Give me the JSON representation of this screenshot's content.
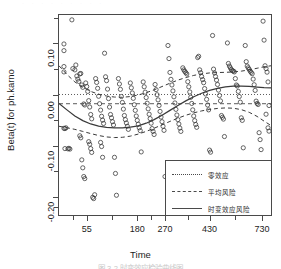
{
  "figure": {
    "top_bleed_text": "· · ·   · · · ·   · ·",
    "caption": "图 3-2  时变效应检验曲线图"
  },
  "axes": {
    "ylabel": "Beta(t) for ph.karno",
    "xlabel": "Time",
    "y_ticks": [
      "0.10",
      "0.00",
      "-0.10",
      "-0.20"
    ],
    "x_ticks": [
      "55",
      "180",
      "270",
      "430",
      "730"
    ]
  },
  "legend": {
    "items": [
      {
        "label": "零效应",
        "style": "dotted"
      },
      {
        "label": "平均风险",
        "style": "dashed"
      },
      {
        "label": "时变效应风险",
        "style": "solid"
      }
    ]
  },
  "chart_data": {
    "type": "scatter",
    "title": "",
    "xlabel": "Time",
    "ylabel": "Beta(t) for ph.karno",
    "xlim": [
      0,
      214
    ],
    "ylim": [
      -0.235,
      0.155
    ],
    "ytick_values": [
      0.1,
      0.0,
      -0.1,
      -0.2
    ],
    "xtick_labels": [
      "55",
      "180",
      "270",
      "430",
      "730"
    ],
    "xtick_positions": [
      28,
      79,
      107,
      152,
      205
    ],
    "grid": false,
    "legend_position": "bottom-right",
    "reference_lines": [
      {
        "name": "零效应",
        "y": 0.0,
        "style": "dotted"
      },
      {
        "name": "平均风险",
        "y": -0.018,
        "style": "dashed"
      }
    ],
    "series": [
      {
        "name": "时变效应风险",
        "type": "line",
        "style": "solid",
        "points": [
          [
            0,
            -0.0175
          ],
          [
            8,
            -0.03
          ],
          [
            16,
            -0.042
          ],
          [
            24,
            -0.051
          ],
          [
            32,
            -0.0575
          ],
          [
            40,
            -0.0615
          ],
          [
            48,
            -0.064
          ],
          [
            56,
            -0.065
          ],
          [
            64,
            -0.065
          ],
          [
            72,
            -0.0638
          ],
          [
            80,
            -0.061
          ],
          [
            88,
            -0.056
          ],
          [
            96,
            -0.049
          ],
          [
            104,
            -0.0405
          ],
          [
            112,
            -0.031
          ],
          [
            120,
            -0.0215
          ],
          [
            128,
            -0.0125
          ],
          [
            136,
            -0.0045
          ],
          [
            144,
            0.0025
          ],
          [
            152,
            0.008
          ],
          [
            160,
            0.012
          ],
          [
            168,
            0.0148
          ],
          [
            176,
            0.0162
          ],
          [
            184,
            0.0165
          ],
          [
            192,
            0.0158
          ],
          [
            200,
            0.0145
          ],
          [
            207,
            0.0135
          ],
          [
            214,
            0.013
          ]
        ]
      },
      {
        "name": "上置信带",
        "type": "line",
        "style": "dashed",
        "points": [
          [
            0,
            0.056
          ],
          [
            8,
            0.039
          ],
          [
            16,
            0.0245
          ],
          [
            24,
            0.014
          ],
          [
            32,
            0.006
          ],
          [
            40,
            0.0005
          ],
          [
            48,
            -0.003
          ],
          [
            56,
            -0.005
          ],
          [
            64,
            -0.0055
          ],
          [
            72,
            -0.004
          ],
          [
            80,
            -0.001
          ],
          [
            88,
            0.0035
          ],
          [
            96,
            0.009
          ],
          [
            104,
            0.0155
          ],
          [
            112,
            0.022
          ],
          [
            120,
            0.028
          ],
          [
            128,
            0.033
          ],
          [
            136,
            0.0372
          ],
          [
            144,
            0.0402
          ],
          [
            152,
            0.042
          ],
          [
            160,
            0.0428
          ],
          [
            168,
            0.0432
          ],
          [
            176,
            0.044
          ],
          [
            184,
            0.0455
          ],
          [
            192,
            0.048
          ],
          [
            200,
            0.0512
          ],
          [
            207,
            0.054
          ],
          [
            214,
            0.056
          ]
        ]
      },
      {
        "name": "下置信带",
        "type": "line",
        "style": "dashed",
        "points": [
          [
            0,
            -0.062
          ],
          [
            8,
            -0.0648
          ],
          [
            16,
            -0.068
          ],
          [
            24,
            -0.072
          ],
          [
            32,
            -0.0762
          ],
          [
            40,
            -0.08
          ],
          [
            48,
            -0.0828
          ],
          [
            56,
            -0.084
          ],
          [
            64,
            -0.0835
          ],
          [
            72,
            -0.0812
          ],
          [
            80,
            -0.0772
          ],
          [
            88,
            -0.072
          ],
          [
            96,
            -0.0658
          ],
          [
            104,
            -0.0592
          ],
          [
            112,
            -0.0525
          ],
          [
            120,
            -0.0462
          ],
          [
            128,
            -0.0405
          ],
          [
            136,
            -0.0358
          ],
          [
            144,
            -0.032
          ],
          [
            152,
            -0.0292
          ],
          [
            160,
            -0.0272
          ],
          [
            168,
            -0.0262
          ],
          [
            176,
            -0.0268
          ],
          [
            184,
            -0.0295
          ],
          [
            192,
            -0.0348
          ],
          [
            200,
            -0.0428
          ],
          [
            207,
            -0.052
          ],
          [
            214,
            -0.0605
          ]
        ]
      },
      {
        "name": "Schoenfeld 残差",
        "type": "scatter",
        "marker": "open-circle",
        "points": [
          [
            5,
            0.0985
          ],
          [
            5,
            0.0855
          ],
          [
            5,
            0.0545
          ],
          [
            5,
            0.044
          ],
          [
            5,
            -0.066
          ],
          [
            6,
            -0.0665
          ],
          [
            7,
            -0.065
          ],
          [
            6,
            -0.1055
          ],
          [
            9,
            -0.106
          ],
          [
            10,
            -0.105
          ],
          [
            11,
            -0.1065
          ],
          [
            13,
            0.1455
          ],
          [
            14,
            0.0505
          ],
          [
            16,
            0.048
          ],
          [
            17,
            0.0575
          ],
          [
            18,
            0.036
          ],
          [
            19,
            0.03
          ],
          [
            20,
            0.0255
          ],
          [
            21,
            0.04
          ],
          [
            22,
            0.041
          ],
          [
            23,
            0.0185
          ],
          [
            24,
            0.014
          ],
          [
            25,
            -0.0185
          ],
          [
            26,
            -0.0205
          ],
          [
            21,
            -0.0805
          ],
          [
            22,
            -0.0845
          ],
          [
            23,
            -0.1275
          ],
          [
            24,
            -0.143
          ],
          [
            25,
            -0.16
          ],
          [
            26,
            -0.164
          ],
          [
            27,
            0.0225
          ],
          [
            28,
            0.0155
          ],
          [
            29,
            0.006
          ],
          [
            30,
            -0.012
          ],
          [
            31,
            -0.0245
          ],
          [
            32,
            -0.039
          ],
          [
            33,
            -0.0475
          ],
          [
            30,
            -0.092
          ],
          [
            31,
            -0.097
          ],
          [
            32,
            -0.1055
          ],
          [
            33,
            -0.113
          ],
          [
            34,
            -0.2005
          ],
          [
            35,
            -0.203
          ],
          [
            36,
            -0.1955
          ],
          [
            37,
            0.031
          ],
          [
            38,
            0.0235
          ],
          [
            39,
            0.012
          ],
          [
            40,
            -0.0035
          ],
          [
            41,
            -0.018
          ],
          [
            42,
            -0.0305
          ],
          [
            43,
            -0.0425
          ],
          [
            44,
            -0.05
          ],
          [
            45,
            -0.0565
          ],
          [
            42,
            -0.0935
          ],
          [
            43,
            -0.1015
          ],
          [
            44,
            -0.1225
          ],
          [
            46,
            0.0805
          ],
          [
            47,
            0.0345
          ],
          [
            48,
            0.027
          ],
          [
            49,
            0.0105
          ],
          [
            50,
            -0.008
          ],
          [
            51,
            -0.0245
          ],
          [
            52,
            -0.039
          ],
          [
            53,
            -0.0455
          ],
          [
            54,
            -0.053
          ],
          [
            55,
            -0.0595
          ],
          [
            56,
            -0.1225
          ],
          [
            57,
            -0.154
          ],
          [
            58,
            -0.1965
          ],
          [
            60,
            0.031
          ],
          [
            61,
            0.0205
          ],
          [
            62,
            0.01
          ],
          [
            63,
            -0.004
          ],
          [
            64,
            -0.0155
          ],
          [
            65,
            -0.0285
          ],
          [
            66,
            -0.041
          ],
          [
            67,
            -0.049
          ],
          [
            68,
            -0.0555
          ],
          [
            69,
            -0.062
          ],
          [
            70,
            -0.068
          ],
          [
            72,
            0.0225
          ],
          [
            73,
            0.013
          ],
          [
            74,
            0.003
          ],
          [
            75,
            -0.0075
          ],
          [
            76,
            -0.02
          ],
          [
            77,
            -0.031
          ],
          [
            78,
            -0.042
          ],
          [
            79,
            -0.0505
          ],
          [
            80,
            -0.058
          ],
          [
            81,
            -0.065
          ],
          [
            82,
            -0.0705
          ],
          [
            83,
            -0.112
          ],
          [
            85,
            0.0245
          ],
          [
            86,
            0.015
          ],
          [
            87,
            0.0045
          ],
          [
            88,
            -0.006
          ],
          [
            89,
            -0.017
          ],
          [
            90,
            -0.028
          ],
          [
            91,
            -0.0385
          ],
          [
            92,
            -0.047
          ],
          [
            93,
            -0.056
          ],
          [
            94,
            -0.0665
          ],
          [
            95,
            -0.072
          ],
          [
            96,
            -0.078
          ],
          [
            97,
            0.0195
          ],
          [
            98,
            0.0095
          ],
          [
            99,
            -0.0005
          ],
          [
            100,
            -0.0105
          ],
          [
            101,
            -0.0215
          ],
          [
            102,
            -0.033
          ],
          [
            103,
            -0.044
          ],
          [
            104,
            -0.053
          ],
          [
            105,
            -0.062
          ],
          [
            106,
            -0.07
          ],
          [
            107,
            -0.16
          ],
          [
            110,
            0.0955
          ],
          [
            111,
            0.07
          ],
          [
            112,
            0.043
          ],
          [
            113,
            0.0295
          ],
          [
            114,
            0.0185
          ],
          [
            115,
            0.007
          ],
          [
            116,
            -0.0045
          ],
          [
            117,
            -0.0165
          ],
          [
            118,
            -0.029
          ],
          [
            119,
            -0.04
          ],
          [
            120,
            -0.049
          ],
          [
            121,
            -0.0575
          ],
          [
            122,
            -0.0655
          ],
          [
            123,
            -0.072
          ],
          [
            125,
            0.052
          ],
          [
            126,
            0.048
          ],
          [
            127,
            0.045
          ],
          [
            128,
            0.0425
          ],
          [
            129,
            0.04
          ],
          [
            130,
            0.025
          ],
          [
            131,
            0.015
          ],
          [
            132,
            0.005
          ],
          [
            133,
            -0.0055
          ],
          [
            134,
            -0.0175
          ],
          [
            135,
            -0.03
          ],
          [
            136,
            -0.042
          ],
          [
            137,
            -0.051
          ],
          [
            138,
            -0.0585
          ],
          [
            139,
            -0.064
          ],
          [
            140,
            0.072
          ],
          [
            141,
            0.0745
          ],
          [
            142,
            0.048
          ],
          [
            143,
            0.0425
          ],
          [
            144,
            0.035
          ],
          [
            145,
            0.029
          ],
          [
            146,
            0.023
          ],
          [
            147,
            0.0115
          ],
          [
            148,
            0.001
          ],
          [
            149,
            -0.0095
          ],
          [
            150,
            -0.0205
          ],
          [
            151,
            -0.03
          ],
          [
            152,
            -0.1085
          ],
          [
            153,
            -0.1125
          ],
          [
            155,
            0.115
          ],
          [
            156,
            0.0495
          ],
          [
            157,
            0.042
          ],
          [
            158,
            0.035
          ],
          [
            159,
            0.028
          ],
          [
            160,
            0.0195
          ],
          [
            161,
            0.0085
          ],
          [
            162,
            -0.002
          ],
          [
            163,
            -0.0125
          ],
          [
            164,
            -0.041
          ],
          [
            165,
            -0.0445
          ],
          [
            166,
            -0.048
          ],
          [
            167,
            -0.082
          ],
          [
            170,
            0.1005
          ],
          [
            171,
            0.0605
          ],
          [
            172,
            0.0555
          ],
          [
            173,
            0.052
          ],
          [
            174,
            0.0485
          ],
          [
            175,
            0.0465
          ],
          [
            176,
            0.0455
          ],
          [
            177,
            0.044
          ],
          [
            178,
            0.031
          ],
          [
            179,
            0.0185
          ],
          [
            180,
            0.0165
          ],
          [
            181,
            0.006
          ],
          [
            182,
            -0.004
          ],
          [
            183,
            -0.015
          ],
          [
            184,
            -0.0455
          ],
          [
            185,
            -0.0505
          ],
          [
            186,
            -0.104
          ],
          [
            188,
            0.0955
          ],
          [
            189,
            0.064
          ],
          [
            190,
            0.0555
          ],
          [
            191,
            0.052
          ],
          [
            192,
            0.049
          ],
          [
            193,
            0.0455
          ],
          [
            194,
            0.043
          ],
          [
            195,
            0.0405
          ],
          [
            196,
            0.03
          ],
          [
            197,
            0.019
          ],
          [
            198,
            0.008
          ],
          [
            199,
            -0.013
          ],
          [
            200,
            -0.0175
          ],
          [
            201,
            -0.0195
          ],
          [
            202,
            -0.0745
          ],
          [
            203,
            -0.088
          ],
          [
            204,
            -0.1075
          ],
          [
            206,
            0.143
          ],
          [
            207,
            0.106
          ],
          [
            208,
            0.056
          ],
          [
            209,
            0.0505
          ],
          [
            210,
            0.0435
          ],
          [
            211,
            0.0245
          ],
          [
            212,
            -0.0215
          ],
          [
            211,
            -0.065
          ],
          [
            212,
            -0.0715
          ],
          [
            209,
            -0.0385
          ]
        ]
      }
    ]
  }
}
